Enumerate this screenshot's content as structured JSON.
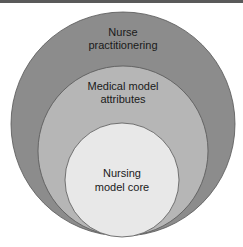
{
  "diagram": {
    "type": "nested-circles",
    "layers": [
      {
        "label_lines": [
          "Nurse",
          "practitionering"
        ],
        "fill": "#8c8c8c"
      },
      {
        "label_lines": [
          "Medical model",
          "attributes"
        ],
        "fill": "#b6b6b6"
      },
      {
        "label_lines": [
          "Nursing",
          "model core"
        ],
        "fill": "#e8e8e8"
      }
    ]
  }
}
